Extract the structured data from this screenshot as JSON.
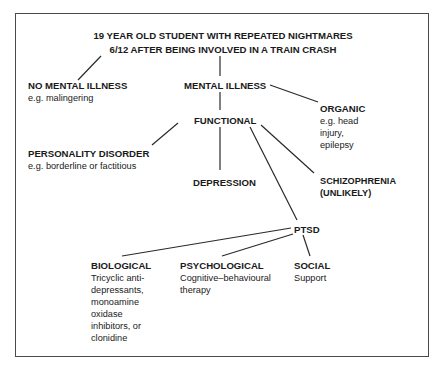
{
  "diagram": {
    "title": {
      "line1": "19 YEAR OLD STUDENT WITH REPEATED NIGHTMARES",
      "line2": "6/12 AFTER BEING INVOLVED IN A TRAIN CRASH"
    },
    "nodes": {
      "no_mental_illness": {
        "label": "NO MENTAL ILLNESS",
        "example": "e.g. malingering"
      },
      "mental_illness": {
        "label": "MENTAL ILLNESS"
      },
      "organic": {
        "label": "ORGANIC",
        "example_lines": [
          "e.g. head",
          "injury,",
          "epilepsy"
        ]
      },
      "functional": {
        "label": "FUNCTIONAL"
      },
      "personality_disorder": {
        "label": "PERSONALITY DISORDER",
        "example": "e.g. borderline or factitious"
      },
      "depression": {
        "label": "DEPRESSION"
      },
      "schizophrenia": {
        "label_lines": [
          "SCHIZOPHRENIA",
          "(UNLIKELY)"
        ]
      },
      "ptsd": {
        "label": "PTSD"
      },
      "biological": {
        "label": "BIOLOGICAL",
        "detail_lines": [
          "Tricyclic anti-",
          "depressants,",
          "monoamine",
          "oxidase",
          "inhibitors, or",
          "clonidine"
        ]
      },
      "psychological": {
        "label": "PSYCHOLOGICAL",
        "detail_lines": [
          "Cognitive–behavioural",
          "therapy"
        ]
      },
      "social": {
        "label": "SOCIAL",
        "detail_lines": [
          "Support"
        ]
      }
    },
    "edges": [
      [
        "title",
        "no_mental_illness"
      ],
      [
        "title",
        "mental_illness"
      ],
      [
        "mental_illness",
        "organic"
      ],
      [
        "mental_illness",
        "functional"
      ],
      [
        "functional",
        "personality_disorder"
      ],
      [
        "functional",
        "depression"
      ],
      [
        "functional",
        "schizophrenia"
      ],
      [
        "functional",
        "ptsd"
      ],
      [
        "ptsd",
        "biological"
      ],
      [
        "ptsd",
        "psychological"
      ],
      [
        "ptsd",
        "social"
      ]
    ],
    "colors": {
      "line": "#2a2a2a",
      "text": "#1a1a1a",
      "frame": "#4a4a4a",
      "background": "#ffffff"
    }
  }
}
